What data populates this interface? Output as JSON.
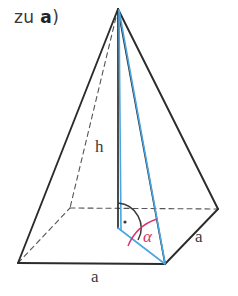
{
  "heading": {
    "prefix": "zu ",
    "bold_part": "a",
    "suffix": ")",
    "full": "zu a)"
  },
  "figure": {
    "name": "square-pyramid-with-angle-alpha",
    "labels": {
      "height": "h",
      "base_edge_front": "a",
      "base_edge_right": "a",
      "angle": "α"
    },
    "colors": {
      "outline": "#2b2b2b",
      "hidden_edge": "#555555",
      "auxiliary_blue": "#49a6e0",
      "angle_red": "#d6336c",
      "right_angle": "#3a3a3a",
      "background": "#ffffff",
      "text": "#3c3c3c",
      "heading_text": "#3a3a3a"
    },
    "geometry": {
      "apex": [
        118,
        9
      ],
      "base_front_left": [
        18,
        263
      ],
      "base_front_right": [
        165,
        264
      ],
      "base_right": [
        218,
        209
      ],
      "base_rear_hidden": [
        70,
        208
      ],
      "base_center": [
        118,
        228
      ]
    },
    "elements": {
      "solid_edges": [
        "apex-to-front-left",
        "apex-to-front-right",
        "apex-to-right",
        "front-left-to-front-right",
        "front-right-to-right"
      ],
      "hidden_edges": [
        "apex-to-rear",
        "front-left-to-rear",
        "rear-to-right",
        "center-to-rear-dashed",
        "center-to-right-dashed"
      ],
      "auxiliary_lines": [
        "apex-to-front-right-slant",
        "apex-to-center-height-aux",
        "center-to-front-right"
      ],
      "markers": [
        "right-angle-dot-at-center",
        "angle-arc-alpha-at-front-right"
      ]
    }
  }
}
